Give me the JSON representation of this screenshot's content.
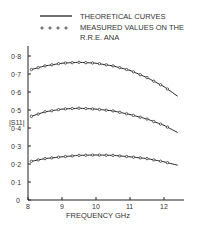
{
  "chart_data": {
    "type": "line",
    "title": "",
    "xlabel": "FREQUENCY GHz",
    "ylabel": "|S11|",
    "xlim": [
      8,
      12.5
    ],
    "ylim": [
      0,
      0.85
    ],
    "xticks": [
      "8",
      "9",
      "10",
      "11",
      "12"
    ],
    "yticks": [
      "0",
      "0·1",
      "0·2",
      "0·3",
      "0·4",
      "0·5",
      "0·6",
      "0·7",
      "0·8"
    ],
    "legend": {
      "line": "THEORETICAL CURVES",
      "markers": "MEASURED VALUES ON THE R.R.E. ANA",
      "position": "top"
    },
    "x": [
      8.1,
      8.5,
      9.0,
      9.5,
      10.0,
      10.5,
      11.0,
      11.5,
      12.0,
      12.3
    ],
    "series": [
      {
        "name": "curve-1",
        "values": [
          0.725,
          0.745,
          0.76,
          0.765,
          0.76,
          0.745,
          0.72,
          0.68,
          0.63,
          0.59
        ]
      },
      {
        "name": "curve-2",
        "values": [
          0.465,
          0.49,
          0.505,
          0.51,
          0.505,
          0.495,
          0.475,
          0.45,
          0.415,
          0.385
        ]
      },
      {
        "name": "curve-3",
        "values": [
          0.215,
          0.23,
          0.24,
          0.248,
          0.25,
          0.248,
          0.24,
          0.23,
          0.212,
          0.198
        ]
      }
    ]
  }
}
